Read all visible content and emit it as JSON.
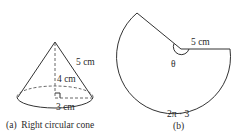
{
  "figure_a": {
    "caption": "(a)  Right circular cone",
    "slant_label": "5 cm",
    "height_label": "4 cm",
    "radius_label": "3 cm"
  },
  "figure_b": {
    "caption": "(b)",
    "radius_label": "5 cm",
    "angle_label": "θ",
    "arc_label": "2π · 3"
  },
  "colors": {
    "line": "#333333",
    "text": "#2a2a2a",
    "background": "#ffffff"
  }
}
